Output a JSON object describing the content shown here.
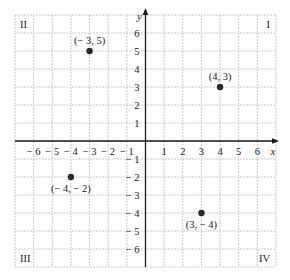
{
  "chart_data": {
    "type": "scatter",
    "title": "",
    "xlabel": "x",
    "ylabel": "y",
    "xlim": [
      -7,
      7
    ],
    "ylim": [
      -7,
      7
    ],
    "grid": true,
    "x_ticks": [
      -6,
      -5,
      -4,
      -3,
      -2,
      -1,
      1,
      2,
      3,
      4,
      5,
      6
    ],
    "y_ticks": [
      -6,
      -5,
      -4,
      -3,
      -2,
      -1,
      1,
      2,
      3,
      4,
      5,
      6
    ],
    "points": [
      {
        "x": -3,
        "y": 5,
        "label": "(− 3, 5)",
        "label_pos": "above"
      },
      {
        "x": 4,
        "y": 3,
        "label": "(4, 3)",
        "label_pos": "above"
      },
      {
        "x": -4,
        "y": -2,
        "label": "(− 4, − 2)",
        "label_pos": "below"
      },
      {
        "x": 3,
        "y": -4,
        "label": "(3, − 4)",
        "label_pos": "below"
      }
    ],
    "quadrant_labels": [
      {
        "label": "I",
        "corner": "top-right"
      },
      {
        "label": "II",
        "corner": "top-left"
      },
      {
        "label": "III",
        "corner": "bottom-left"
      },
      {
        "label": "IV",
        "corner": "bottom-right"
      }
    ]
  },
  "colors": {
    "grid": "#bdbdbd",
    "axis": "#1a1a1a",
    "point": "#2a2a2a",
    "text": "#222222",
    "frame": "#bdbdbd"
  },
  "axis_labels": {
    "x": "x",
    "y": "y"
  }
}
